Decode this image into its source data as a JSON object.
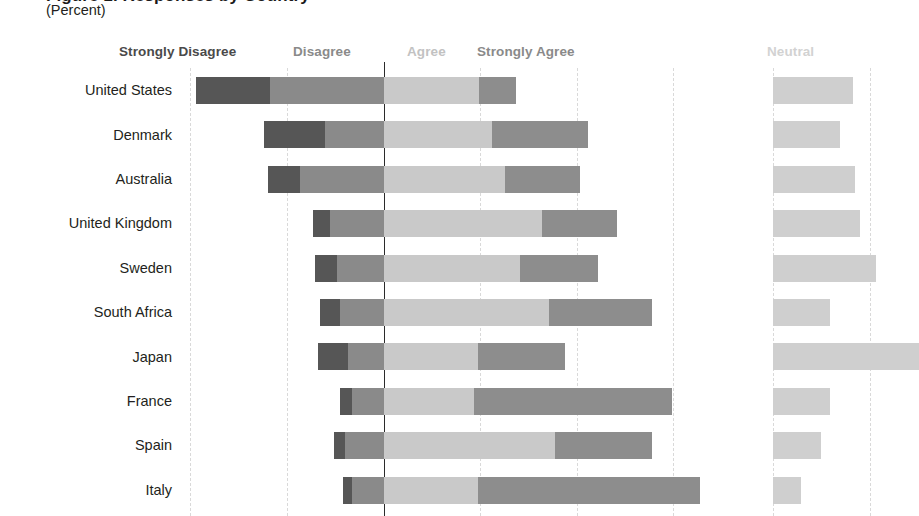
{
  "header": {
    "title_clipped": "Figure 1. Responses by Country",
    "subtitle": "(Percent)"
  },
  "legend": {
    "strongly_disagree": "Strongly Disagree",
    "disagree": "Disagree",
    "agree": "Agree",
    "strongly_agree": "Strongly Agree",
    "neutral": "Neutral"
  },
  "chart_data": {
    "type": "bar",
    "subtype": "diverging-stacked-horizontal",
    "title": "(Percent)",
    "xlabel": "",
    "ylabel": "",
    "grid": true,
    "legend_position": "top",
    "zero_line_px": 384,
    "axis": {
      "left_gridline_px": 190,
      "gridline_spacing_px": 96.5,
      "neutral_panel_start_px": 773
    },
    "categories": [
      "United States",
      "Denmark",
      "Australia",
      "United Kingdom",
      "Sweden",
      "South Africa",
      "Japan",
      "France",
      "Spain",
      "Italy"
    ],
    "series": [
      {
        "name": "Strongly Disagree",
        "color": "#565656",
        "values": [
          19.5,
          15.8,
          8.3,
          4.4,
          5.7,
          5.2,
          7.8,
          3.1,
          2.8,
          2.3
        ]
      },
      {
        "name": "Disagree",
        "color": "#8a8a8a",
        "values": [
          29.5,
          15.3,
          21.8,
          14.0,
          12.2,
          11.4,
          9.3,
          8.3,
          10.1,
          8.3
        ]
      },
      {
        "name": "Agree",
        "color": "#c9c9c9",
        "values": [
          24.6,
          28.0,
          31.3,
          40.9,
          35.2,
          42.7,
          24.4,
          23.3,
          44.3,
          24.4
        ]
      },
      {
        "name": "Strongly Agree",
        "color": "#8d8d8d",
        "values": [
          9.6,
          24.9,
          19.4,
          19.4,
          20.2,
          26.7,
          22.5,
          51.3,
          25.1,
          57.5
        ]
      },
      {
        "name": "Neutral",
        "color": "#cfcfcf",
        "values": [
          20.7,
          17.4,
          21.2,
          22.5,
          26.7,
          14.8,
          29.3,
          14.8,
          12.4,
          7.3
        ]
      }
    ],
    "rows": [
      {
        "country": "United States",
        "strongly_disagree_px": {
          "x": 196,
          "w": 74
        },
        "disagree_px": {
          "x": 270,
          "w": 114
        },
        "agree_px": {
          "x": 384,
          "w": 95
        },
        "strongly_agree_px": {
          "x": 479,
          "w": 37
        },
        "neutral_px": {
          "x": 773,
          "w": 80
        }
      },
      {
        "country": "Denmark",
        "strongly_disagree_px": {
          "x": 264,
          "w": 61
        },
        "disagree_px": {
          "x": 325,
          "w": 59
        },
        "agree_px": {
          "x": 384,
          "w": 108
        },
        "strongly_agree_px": {
          "x": 492,
          "w": 96
        },
        "neutral_px": {
          "x": 773,
          "w": 67
        }
      },
      {
        "country": "Australia",
        "strongly_disagree_px": {
          "x": 268,
          "w": 32
        },
        "disagree_px": {
          "x": 300,
          "w": 84
        },
        "agree_px": {
          "x": 384,
          "w": 121
        },
        "strongly_agree_px": {
          "x": 505,
          "w": 75
        },
        "neutral_px": {
          "x": 773,
          "w": 82
        }
      },
      {
        "country": "United Kingdom",
        "strongly_disagree_px": {
          "x": 313,
          "w": 17
        },
        "disagree_px": {
          "x": 330,
          "w": 54
        },
        "agree_px": {
          "x": 384,
          "w": 158
        },
        "strongly_agree_px": {
          "x": 542,
          "w": 75
        },
        "neutral_px": {
          "x": 773,
          "w": 87
        }
      },
      {
        "country": "Sweden",
        "strongly_disagree_px": {
          "x": 315,
          "w": 22
        },
        "disagree_px": {
          "x": 337,
          "w": 47
        },
        "agree_px": {
          "x": 384,
          "w": 136
        },
        "strongly_agree_px": {
          "x": 520,
          "w": 78
        },
        "neutral_px": {
          "x": 773,
          "w": 103
        }
      },
      {
        "country": "South Africa",
        "strongly_disagree_px": {
          "x": 320,
          "w": 20
        },
        "disagree_px": {
          "x": 340,
          "w": 44
        },
        "agree_px": {
          "x": 384,
          "w": 165
        },
        "strongly_agree_px": {
          "x": 549,
          "w": 103
        },
        "neutral_px": {
          "x": 773,
          "w": 57
        }
      },
      {
        "country": "Japan",
        "strongly_disagree_px": {
          "x": 318,
          "w": 30
        },
        "disagree_px": {
          "x": 348,
          "w": 36
        },
        "agree_px": {
          "x": 384,
          "w": 94
        },
        "strongly_agree_px": {
          "x": 478,
          "w": 87
        },
        "neutral_px": {
          "x": 773,
          "w": 146
        }
      },
      {
        "country": "France",
        "strongly_disagree_px": {
          "x": 340,
          "w": 12
        },
        "disagree_px": {
          "x": 352,
          "w": 32
        },
        "agree_px": {
          "x": 384,
          "w": 90
        },
        "strongly_agree_px": {
          "x": 474,
          "w": 198
        },
        "neutral_px": {
          "x": 773,
          "w": 57
        }
      },
      {
        "country": "Spain",
        "strongly_disagree_px": {
          "x": 334,
          "w": 11
        },
        "disagree_px": {
          "x": 345,
          "w": 39
        },
        "agree_px": {
          "x": 384,
          "w": 171
        },
        "strongly_agree_px": {
          "x": 555,
          "w": 97
        },
        "neutral_px": {
          "x": 773,
          "w": 48
        }
      },
      {
        "country": "Italy",
        "strongly_disagree_px": {
          "x": 343,
          "w": 9
        },
        "disagree_px": {
          "x": 352,
          "w": 32
        },
        "agree_px": {
          "x": 384,
          "w": 94
        },
        "strongly_agree_px": {
          "x": 478,
          "w": 222
        },
        "neutral_px": {
          "x": 773,
          "w": 28
        }
      }
    ],
    "gridlines_px": [
      190,
      286.5,
      384,
      480,
      577,
      673,
      773,
      870
    ]
  }
}
